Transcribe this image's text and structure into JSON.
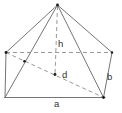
{
  "diagram": {
    "type": "pyramid-wireframe",
    "labels": {
      "height": "h",
      "diagonal": "d",
      "base_front": "a",
      "side_right": "b"
    },
    "colors": {
      "background": "#ffffff",
      "solid_line": "#757575",
      "dashed_line": "#999999",
      "label_text": "#333333",
      "dot": "#1c1c1c"
    }
  }
}
